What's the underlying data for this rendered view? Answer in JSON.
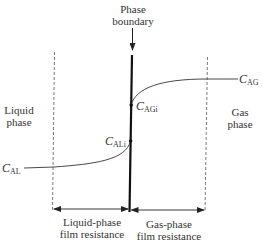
{
  "diagram": {
    "title_label": {
      "line1": "Phase",
      "line2": "boundary"
    },
    "liquid_phase_label": {
      "line1": "Liquid",
      "line2": "phase"
    },
    "gas_phase_label": {
      "line1": "Gas",
      "line2": "phase"
    },
    "concentrations": {
      "C_AG": {
        "symbol": "C",
        "subscript": "AG"
      },
      "C_AGi": {
        "symbol": "C",
        "subscript": "AGi"
      },
      "C_ALi": {
        "symbol": "C",
        "subscript": "ALi"
      },
      "C_AL": {
        "symbol": "C",
        "subscript": "AL"
      }
    },
    "liquid_film_label": {
      "line1": "Liquid-phase",
      "line2": "film resistance"
    },
    "gas_film_label": {
      "line1": "Gas-phase",
      "line2": "film resistance"
    },
    "colors": {
      "line": "#222222",
      "dashed": "#555555",
      "background": "#ffffff"
    }
  }
}
